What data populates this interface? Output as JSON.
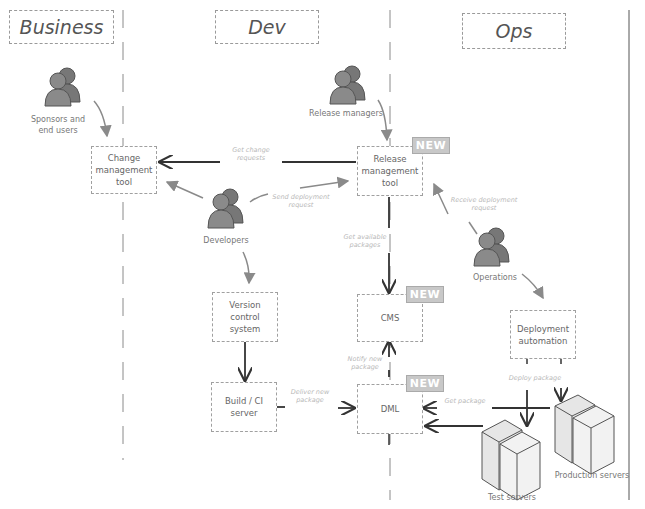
{
  "lanes": [
    {
      "id": "business",
      "label": "Business"
    },
    {
      "id": "dev",
      "label": "Dev"
    },
    {
      "id": "ops",
      "label": "Ops"
    }
  ],
  "actors": {
    "sponsors": "Sponsors and end users",
    "release_managers": "Release managers",
    "developers": "Developers",
    "operations": "Operations"
  },
  "nodes": {
    "change_mgmt": "Change management tool",
    "release_mgmt": "Release management tool",
    "vcs": "Version control system",
    "build_ci": "Build / CI server",
    "cms": "CMS",
    "dml": "DML",
    "deploy_auto": "Deployment automation",
    "test_servers": "Test servers",
    "prod_servers": "Production servers"
  },
  "badges": {
    "new_label": "NEW"
  },
  "edges": {
    "get_change_requests": "Get change requests",
    "send_deployment_request": "Send deployment request",
    "get_available_packages": "Get available packages",
    "receive_deployment_request": "Receive deployment request",
    "notify_new_package": "Notify new package",
    "deliver_new_package": "Deliver new package",
    "get_package": "Get package",
    "deploy_package": "Deploy package"
  }
}
